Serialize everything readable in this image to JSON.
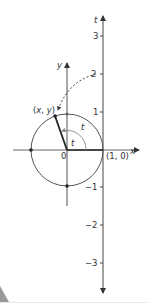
{
  "diagram": {
    "colors": {
      "axis": "#444444",
      "circle": "#555555",
      "arc": "#888888",
      "radius": "#222222",
      "text": "#333333",
      "corner": "#9a9a9a"
    },
    "labels": {
      "x_axis": "x",
      "y_axis": "y",
      "t_axis": "t",
      "origin": "0",
      "point_xy": "(x, y)",
      "point_10": "(1, 0)",
      "arc_t_outer": "t",
      "angle_t_inner": "t"
    },
    "t_ticks": [
      "3",
      "2",
      "1",
      "−1",
      "−2",
      "−3"
    ],
    "points": [
      "(x, y)",
      "(0, 1)",
      "(-1, 0)",
      "(0, -1)",
      "(1, 0)"
    ]
  }
}
